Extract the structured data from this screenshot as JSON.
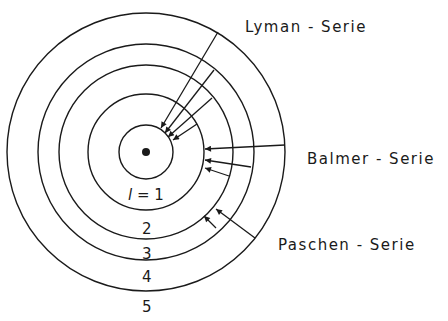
{
  "series_labels": {
    "lyman": "Lyman - Serie",
    "balmer": "Balmer - Serie",
    "paschen": "Paschen - Serie"
  },
  "shell_labels": {
    "l1_var": "l",
    "l1_eq": " = 1",
    "l2": "2",
    "l3": "3",
    "l4": "4",
    "l5": "5"
  },
  "colors": {
    "ink": "#1a1a1a",
    "background": "#ffffff"
  }
}
